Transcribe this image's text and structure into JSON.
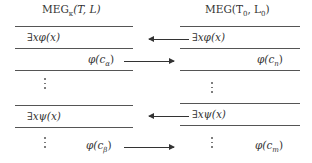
{
  "left_table": {
    "title": "MEG",
    "title_sub": "κ",
    "title_args": "(T, L)",
    "rows": [
      {
        "text": "∃xφ(x)",
        "align": "left"
      },
      {
        "text": "φ(c",
        "sub": "α",
        "close": ")",
        "align": "right"
      },
      {
        "text": "⋮",
        "align": "center"
      },
      {
        "text": "∃xψ(x)",
        "align": "left"
      },
      {
        "text": "φ(c",
        "sub": "β",
        "close": ")",
        "align": "right"
      }
    ]
  },
  "right_table": {
    "title": "MEG(T",
    "title_sub0": "0",
    "title_mid": ", L",
    "title_sub1": "0",
    "title_close": ")",
    "rows": [
      {
        "text": "∃xφ(x)",
        "align": "left"
      },
      {
        "text": "φ(c",
        "sub": "n",
        "close": ")",
        "align": "right"
      },
      {
        "text": "⋮",
        "align": "center"
      },
      {
        "text": "∃xψ(x)",
        "align": "left"
      },
      {
        "text": "φ(c",
        "sub": "m",
        "close": ")",
        "align": "right"
      }
    ]
  },
  "arrows": [
    {
      "from": "right ∃xφ(x)",
      "to": "left",
      "direction": "left"
    },
    {
      "from": "left φ(cα)",
      "to": "right",
      "direction": "right"
    },
    {
      "from": "right ∃xψ(x)",
      "to": "left",
      "direction": "left"
    },
    {
      "from": "left φ(cβ)",
      "to": "right",
      "direction": "right"
    }
  ]
}
